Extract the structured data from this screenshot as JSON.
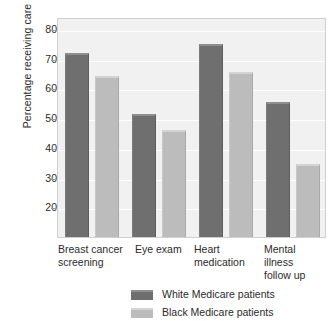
{
  "chart_data": {
    "type": "bar",
    "title": "",
    "xlabel": "",
    "ylabel": "Percentage receiving care",
    "ylim": [
      10,
      84
    ],
    "yticks": [
      20,
      30,
      40,
      50,
      60,
      70,
      80
    ],
    "grid": true,
    "legend_position": "bottom",
    "categories": [
      "Breast cancer screening",
      "Eye exam",
      "Heart medication",
      "Mental illness follow up"
    ],
    "category_lines": [
      [
        "Breast cancer",
        "screening"
      ],
      [
        "Eye exam",
        ""
      ],
      [
        "Heart",
        "medication"
      ],
      [
        "Mental illness",
        "follow up"
      ]
    ],
    "series": [
      {
        "name": "White Medicare patients",
        "color": "#6f6f6f",
        "values": [
          72,
          51.5,
          75,
          55.5
        ]
      },
      {
        "name": "Black Medicare patients",
        "color": "#bcbcbc",
        "values": [
          64,
          46,
          65.5,
          34.5
        ]
      }
    ]
  },
  "colors": {
    "white_series": "#6f6f6f",
    "black_series": "#bcbcbc",
    "plot_background": "#f1f1f1",
    "gridline": "#ffffff",
    "frame": "#cfcfcf",
    "text": "#2b2b2b"
  }
}
